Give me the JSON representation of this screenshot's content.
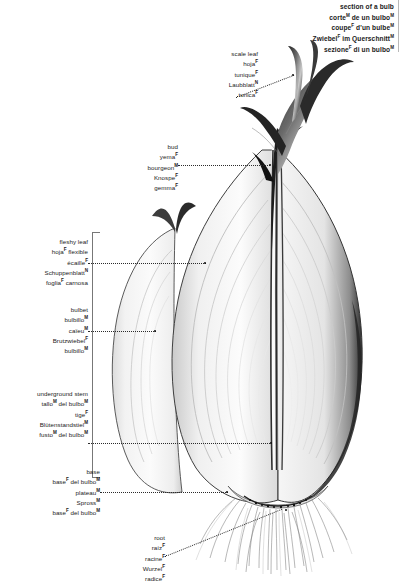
{
  "title": {
    "lines": [
      {
        "text": "section of a bulb",
        "sup": ""
      },
      {
        "text": "corte",
        "sup": "M",
        "rest": " de un bulbo",
        "rest_sup": "M"
      },
      {
        "text": "coupe",
        "sup": "F",
        "rest": " d'un bulbe",
        "rest_sup": "M"
      },
      {
        "text": "Zwiebel",
        "sup": "F",
        "rest": " im Querschnitt",
        "rest_sup": "M"
      },
      {
        "text": "sezione",
        "sup": "F",
        "rest": " di un bulbo",
        "rest_sup": "M"
      }
    ]
  },
  "labels": {
    "scale_leaf": {
      "name": "scale-leaf",
      "lines": [
        {
          "text": "scale leaf",
          "sup": ""
        },
        {
          "text": "hoja",
          "sup": "F"
        },
        {
          "text": "tunique",
          "sup": "F"
        },
        {
          "text": "Laubblatt",
          "sup": "N"
        },
        {
          "text": "tunica",
          "sup": "F"
        }
      ]
    },
    "bud": {
      "name": "bud",
      "lines": [
        {
          "text": "bud",
          "sup": ""
        },
        {
          "text": "yema",
          "sup": "F"
        },
        {
          "text": "bourgeon",
          "sup": "M"
        },
        {
          "text": "Knospe",
          "sup": "F"
        },
        {
          "text": "gemma",
          "sup": "F"
        }
      ]
    },
    "fleshy_leaf": {
      "name": "fleshy-leaf",
      "lines": [
        {
          "text": "fleshy leaf",
          "sup": ""
        },
        {
          "text": "hoja",
          "sup": "F",
          "rest": " flexible"
        },
        {
          "text": "écaille",
          "sup": "F"
        },
        {
          "text": "Schuppenblatt",
          "sup": "N"
        },
        {
          "text": "foglia",
          "sup": "F",
          "rest": " carnosa"
        }
      ]
    },
    "bulbet": {
      "name": "bulbet",
      "lines": [
        {
          "text": "bulbet",
          "sup": ""
        },
        {
          "text": "bulbillo",
          "sup": "M"
        },
        {
          "text": "caïeu",
          "sup": "M"
        },
        {
          "text": "Brutzwiebel",
          "sup": "F"
        },
        {
          "text": "bulbillo",
          "sup": "M"
        }
      ]
    },
    "underground_stem": {
      "name": "underground-stem",
      "lines": [
        {
          "text": "underground stem",
          "sup": ""
        },
        {
          "text": "tallo",
          "sup": "M",
          "rest": " del bulbo",
          "rest_sup": "M"
        },
        {
          "text": "tige",
          "sup": "F"
        },
        {
          "text": "Blütenstandstiel",
          "sup": "M"
        },
        {
          "text": "fusto",
          "sup": "M",
          "rest": " del bulbo",
          "rest_sup": "M"
        }
      ]
    },
    "base": {
      "name": "base",
      "lines": [
        {
          "text": "base",
          "sup": ""
        },
        {
          "text": "base",
          "sup": "F",
          "rest": " del bulbo",
          "rest_sup": "M"
        },
        {
          "text": "plateau",
          "sup": "M"
        },
        {
          "text": "Spross",
          "sup": "M"
        },
        {
          "text": "base",
          "sup": "F",
          "rest": " del bulbo",
          "rest_sup": "M"
        }
      ]
    },
    "root": {
      "name": "root",
      "lines": [
        {
          "text": "root",
          "sup": ""
        },
        {
          "text": "raíz",
          "sup": "F"
        },
        {
          "text": "racine",
          "sup": "F"
        },
        {
          "text": "Wurzel",
          "sup": "F"
        },
        {
          "text": "radice",
          "sup": "F"
        }
      ]
    }
  },
  "colors": {
    "ink": "#1a1a1a",
    "leader": "#2b2b2b",
    "bracket": "#777777",
    "outline_dark": "#3a3a3a",
    "scale_light": "#f4f4f4",
    "scale_mid": "#e2e2e2",
    "background": "#ffffff"
  },
  "illustration": {
    "subject": "onion-bulb-cross-section",
    "parts": [
      "scale-leaf",
      "bud",
      "fleshy-leaf",
      "bulbet",
      "underground-stem",
      "base",
      "root"
    ]
  }
}
